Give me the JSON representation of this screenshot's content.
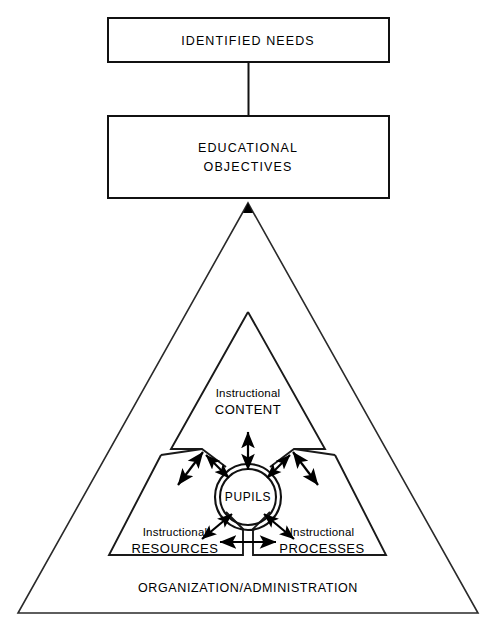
{
  "diagram": {
    "colors": {
      "stroke": "#111111",
      "triangle_stroke": "#2a2a2a",
      "background": "#ffffff",
      "text": "#000000"
    },
    "boxes": [
      {
        "id": "identified-needs",
        "label": "IDENTIFIED NEEDS"
      },
      {
        "id": "educational-objectives",
        "label_line1": "EDUCATIONAL",
        "label_line2": "OBJECTIVES"
      }
    ],
    "connector": {
      "name": "needs-to-objectives-connector"
    },
    "outer_triangle": {
      "id": "organization-administration",
      "label": "ORGANIZATION/ADMINISTRATION"
    },
    "inner_triangle": {
      "id": "instructional-triad",
      "sectors": [
        {
          "id": "instructional-content",
          "label_line1": "Instructional",
          "label_line2": "CONTENT"
        },
        {
          "id": "instructional-resources",
          "label_line1": "Instructional",
          "label_line2": "RESOURCES"
        },
        {
          "id": "instructional-processes",
          "label_line1": "Instructional",
          "label_line2": "PROCESSES"
        }
      ]
    },
    "center_node": {
      "id": "pupils",
      "label": "PUPILS"
    },
    "arrows": [
      {
        "id": "arrow-content-exchange",
        "direction": "bidirectional",
        "orientation": "vertical"
      },
      {
        "id": "arrow-resources-exchange",
        "direction": "bidirectional",
        "orientation": "diagonal-up-left"
      },
      {
        "id": "arrow-processes-exchange",
        "direction": "bidirectional",
        "orientation": "diagonal-up-right"
      },
      {
        "id": "arrow-resources-processes",
        "direction": "bidirectional",
        "orientation": "horizontal"
      },
      {
        "id": "arrow-pupils-up-left",
        "direction": "bidirectional",
        "orientation": "diagonal"
      },
      {
        "id": "arrow-pupils-down-left",
        "direction": "bidirectional",
        "orientation": "diagonal"
      },
      {
        "id": "arrow-pupils-down-right",
        "direction": "bidirectional",
        "orientation": "diagonal"
      },
      {
        "id": "arrow-objectives-apex",
        "direction": "up",
        "orientation": "vertical"
      }
    ]
  }
}
